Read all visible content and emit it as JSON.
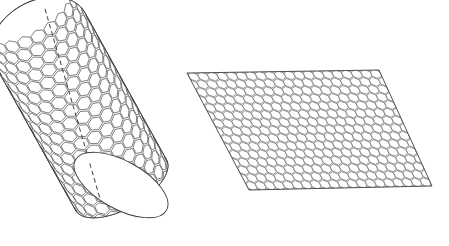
{
  "figure": {
    "title": "Carbon nanotube and unrolled graphene sheet",
    "background_color": "#ffffff",
    "width": 449,
    "height": 246,
    "line_color": "#3c3c3c",
    "lattice_line_color": "#555555",
    "sheet_line_color": "#6a6a6a",
    "axis_line_color": "#4a4a4a",
    "cell_fill_color": "#ffffff"
  },
  "nanotube": {
    "label": "nanotube-cylinder",
    "description": "Tilted cylinder wrapped in a hexagonal lattice with an open elliptical bottom end and a closed rounded top end",
    "axis_angle_degrees": 29,
    "center_x": 107,
    "center_y": 128,
    "tube_length": 168,
    "tube_radius": 52,
    "cap_ry": 24,
    "lattice_rings_around": 22,
    "lattice_rows_along": 17,
    "axis": {
      "label": "tube-axis-dashed-line",
      "style": "dashed",
      "x1": 45,
      "y1": 9,
      "x2": 101,
      "y2": 202,
      "dash_pattern": "4.5 3.2"
    },
    "open_end": {
      "label": "open-tube-end-ellipse",
      "cx": 121,
      "cy": 185,
      "rx": 52,
      "ry": 24,
      "rotation_degrees": 29,
      "fill": "#ffffff"
    }
  },
  "graphene_sheet": {
    "label": "graphene-sheet-parallelogram",
    "description": "Flat parallelogram tiled with a honeycomb hexagonal lattice representing an unrolled nanotube wall",
    "vertices": [
      {
        "name": "top-left",
        "x": 187,
        "y": 73
      },
      {
        "name": "top-right",
        "x": 379,
        "y": 70
      },
      {
        "name": "bottom-right",
        "x": 432,
        "y": 186
      },
      {
        "name": "bottom-left",
        "x": 249,
        "y": 190
      }
    ],
    "columns": 20,
    "rows": 15,
    "hex_flatten": 0.86
  }
}
